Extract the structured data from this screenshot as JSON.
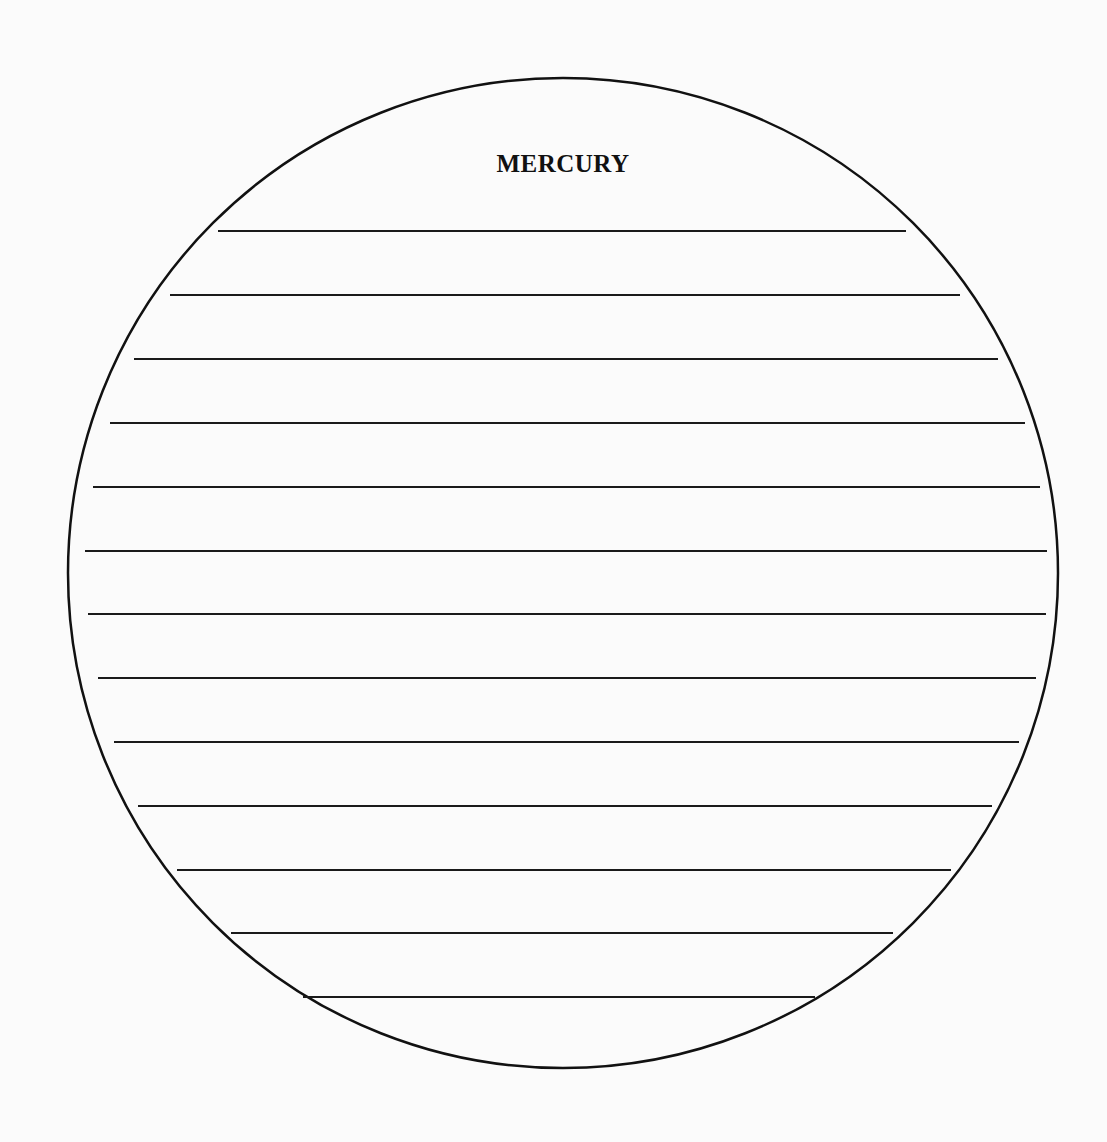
{
  "worksheet": {
    "title": "MERCURY",
    "shape": "circle",
    "circle": {
      "cx": 563,
      "cy": 573,
      "r": 495,
      "stroke": "#111111",
      "stroke_width": 2.5
    },
    "line_color": "#1a1a1a",
    "writing_lines": [
      {
        "y": 231,
        "x1": 218,
        "x2": 906
      },
      {
        "y": 295,
        "x1": 170,
        "x2": 960
      },
      {
        "y": 359,
        "x1": 134,
        "x2": 998
      },
      {
        "y": 423,
        "x1": 110,
        "x2": 1025
      },
      {
        "y": 487,
        "x1": 93,
        "x2": 1040
      },
      {
        "y": 551,
        "x1": 85,
        "x2": 1047
      },
      {
        "y": 614,
        "x1": 88,
        "x2": 1046
      },
      {
        "y": 678,
        "x1": 98,
        "x2": 1036
      },
      {
        "y": 742,
        "x1": 114,
        "x2": 1019
      },
      {
        "y": 806,
        "x1": 138,
        "x2": 992
      },
      {
        "y": 870,
        "x1": 177,
        "x2": 951
      },
      {
        "y": 933,
        "x1": 231,
        "x2": 893
      },
      {
        "y": 997,
        "x1": 303,
        "x2": 815
      }
    ]
  }
}
